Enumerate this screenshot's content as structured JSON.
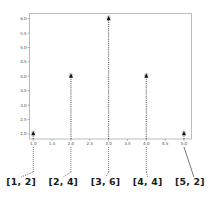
{
  "chart_data": {
    "type": "scatter",
    "title": "",
    "xlabel": "",
    "ylabel": "",
    "x": [
      1,
      2,
      3,
      4,
      5
    ],
    "values": [
      2,
      4,
      6,
      4,
      2
    ],
    "point_labels": [
      "[1, 2]",
      "[2, 4]",
      "[3, 6]",
      "[4, 4]",
      "[5, 2]"
    ],
    "xlim": [
      0.9,
      5.2
    ],
    "ylim": [
      1.82,
      6.18
    ],
    "xticks": [
      "1.0",
      "1.5",
      "2.0",
      "2.5",
      "3.0",
      "3.5",
      "4.0",
      "4.5",
      "5.0"
    ],
    "xtick_values": [
      1.0,
      1.5,
      2.0,
      2.5,
      3.0,
      3.5,
      4.0,
      4.5,
      5.0
    ],
    "yticks": [
      "2.0",
      "2.5",
      "3.0",
      "3.5",
      "4.0",
      "4.5",
      "5.0",
      "5.5",
      "6.0"
    ],
    "ytick_values": [
      2.0,
      2.5,
      3.0,
      3.5,
      4.0,
      4.5,
      5.0,
      5.5,
      6.0
    ],
    "grid": false,
    "legend": null,
    "marker_style": "triangle",
    "stem_style": "dotted",
    "colors": {
      "marker": "#111111",
      "stem": "#555555",
      "frame": "#b6b6b6",
      "tick_label": "#4a4a4a",
      "pair_label": "#1a1a1a",
      "background": "#ffffff"
    }
  }
}
